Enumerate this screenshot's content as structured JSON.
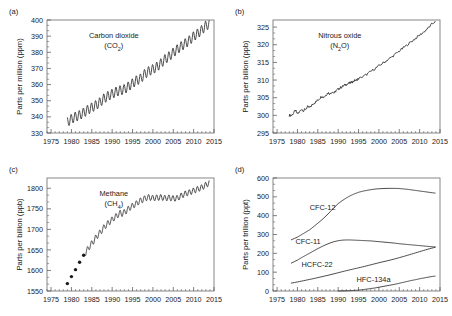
{
  "figure": {
    "title": "",
    "background_color": "#ffffff",
    "line_color": "#2b2b2b",
    "frame_color": "#7a7a7a"
  },
  "chart_data": [
    {
      "id": "panel-a",
      "type": "line",
      "panel_letter": "(a)",
      "title": "",
      "annotation": "Carbon dioxide",
      "annotation_sub": "(CO2)",
      "annotation_formula": "CO",
      "annotation_subscript": "2",
      "xlabel": "",
      "ylabel": "Parts per million (ppm)",
      "xlim": [
        1974,
        2015
      ],
      "ylim": [
        330,
        400
      ],
      "xticks": [
        1975,
        1980,
        1985,
        1990,
        1995,
        2000,
        2005,
        2010,
        2015
      ],
      "yticks": [
        330,
        340,
        350,
        360,
        370,
        380,
        390,
        400
      ],
      "minor_x_interval": 1,
      "minor_y_count": 2,
      "grid": false,
      "legend": "none",
      "seasonal_amplitude": 3.0,
      "seasonal_period": 1,
      "x": [
        1979.0,
        1980.0,
        1981.0,
        1982.0,
        1983.0,
        1984.0,
        1985.0,
        1986.0,
        1987.0,
        1988.0,
        1989.0,
        1990.0,
        1991.0,
        1992.0,
        1993.0,
        1994.0,
        1995.0,
        1996.0,
        1997.0,
        1998.0,
        1999.0,
        2000.0,
        2001.0,
        2002.0,
        2003.0,
        2004.0,
        2005.0,
        2006.0,
        2007.0,
        2008.0,
        2009.0,
        2010.0,
        2011.0,
        2012.0,
        2013.0,
        2013.8
      ],
      "values": [
        336.8,
        338.7,
        340.1,
        341.0,
        342.6,
        344.3,
        345.8,
        347.2,
        349.0,
        351.4,
        352.9,
        354.2,
        355.6,
        356.4,
        357.1,
        358.8,
        360.8,
        362.6,
        363.7,
        366.6,
        368.3,
        369.5,
        371.0,
        373.2,
        375.8,
        377.5,
        379.8,
        381.9,
        383.8,
        385.6,
        387.4,
        389.9,
        391.6,
        393.8,
        396.5,
        397.4
      ]
    },
    {
      "id": "panel-b",
      "type": "line",
      "panel_letter": "(b)",
      "title": "",
      "annotation": "Nitrous oxide",
      "annotation_sub": "(N2O)",
      "annotation_formula_pre": "(N",
      "annotation_subscript": "2",
      "annotation_formula_post": "O)",
      "xlabel": "",
      "ylabel": "Parts per billion (ppb)",
      "xlim": [
        1974,
        2015
      ],
      "ylim": [
        295,
        327
      ],
      "xticks": [
        1975,
        1980,
        1985,
        1990,
        1995,
        2000,
        2005,
        2010,
        2015
      ],
      "yticks": [
        295,
        300,
        305,
        310,
        315,
        320,
        325
      ],
      "minor_x_interval": 1,
      "minor_y_count": 2,
      "grid": false,
      "legend": "none",
      "noise_amplitude": 0.35,
      "x": [
        1978.0,
        1978.5,
        1979.0,
        1979.5,
        1980.0,
        1980.5,
        1981.0,
        1981.5,
        1982.0,
        1982.5,
        1983.0,
        1983.5,
        1984.0,
        1984.5,
        1985.0,
        1985.5,
        1986.0,
        1986.5,
        1987.0,
        1987.5,
        1988.0,
        1988.5,
        1989.0,
        1989.5,
        1990.0,
        1990.5,
        1991.0,
        1991.5,
        1992.0,
        1992.5,
        1993.0,
        1993.5,
        1994.0,
        1994.5,
        1995.0,
        1996.0,
        1997.0,
        1998.0,
        1999.0,
        2000.0,
        2001.0,
        2002.0,
        2003.0,
        2004.0,
        2005.0,
        2006.0,
        2007.0,
        2008.0,
        2009.0,
        2010.0,
        2011.0,
        2012.0,
        2013.0,
        2013.8
      ],
      "values": [
        300.1,
        299.9,
        300.6,
        301.4,
        300.4,
        300.9,
        301.8,
        301.3,
        301.8,
        302.4,
        302.2,
        302.8,
        303.4,
        303.8,
        304.3,
        304.9,
        305.4,
        305.1,
        305.8,
        306.4,
        306.1,
        306.7,
        306.3,
        307.0,
        307.4,
        307.8,
        308.1,
        308.5,
        308.8,
        309.0,
        309.2,
        309.5,
        309.8,
        310.0,
        310.4,
        310.9,
        311.6,
        312.4,
        313.2,
        314.0,
        314.8,
        315.6,
        316.4,
        317.3,
        318.2,
        319.1,
        320.0,
        320.9,
        321.8,
        322.7,
        323.6,
        324.6,
        325.8,
        326.6
      ]
    },
    {
      "id": "panel-c",
      "type": "line",
      "panel_letter": "(c)",
      "title": "",
      "annotation": "Methane",
      "annotation_sub": "(CH4)",
      "annotation_formula_pre": "(CH",
      "annotation_subscript": "4",
      "annotation_formula_post": ")",
      "xlabel": "",
      "ylabel": "Parts per billion (ppb)",
      "xlim": [
        1974,
        2015
      ],
      "ylim": [
        1550,
        1825
      ],
      "xticks": [
        1975,
        1980,
        1985,
        1990,
        1995,
        2000,
        2005,
        2010,
        2015
      ],
      "yticks": [
        1550,
        1600,
        1650,
        1700,
        1750,
        1800
      ],
      "minor_x_interval": 1,
      "minor_y_count": 2,
      "grid": false,
      "legend": "none",
      "seasonal_amplitude": 7.0,
      "marker_points_x": [
        1979.0,
        1980.0,
        1981.0,
        1982.0,
        1983.0
      ],
      "marker_points_y": [
        1568,
        1585,
        1602,
        1620,
        1637
      ],
      "x": [
        1983.5,
        1984.0,
        1984.5,
        1985.0,
        1985.5,
        1986.0,
        1986.5,
        1987.0,
        1987.5,
        1988.0,
        1988.5,
        1989.0,
        1989.5,
        1990.0,
        1990.5,
        1991.0,
        1991.5,
        1992.0,
        1992.5,
        1993.0,
        1993.5,
        1994.0,
        1994.5,
        1995.0,
        1995.5,
        1996.0,
        1996.5,
        1997.0,
        1997.5,
        1998.0,
        1998.5,
        1999.0,
        2000.0,
        2001.0,
        2002.0,
        2003.0,
        2004.0,
        2005.0,
        2006.0,
        2007.0,
        2008.0,
        2009.0,
        2010.0,
        2011.0,
        2012.0,
        2013.0,
        2013.8
      ],
      "values": [
        1643,
        1652,
        1659,
        1666,
        1672,
        1680,
        1686,
        1692,
        1698,
        1705,
        1710,
        1715,
        1719,
        1724,
        1728,
        1732,
        1736,
        1740,
        1738,
        1742,
        1745,
        1750,
        1754,
        1757,
        1760,
        1763,
        1767,
        1770,
        1772,
        1775,
        1777,
        1778,
        1776,
        1777,
        1778,
        1776,
        1777,
        1775,
        1776,
        1782,
        1787,
        1790,
        1794,
        1798,
        1802,
        1808,
        1813
      ]
    },
    {
      "id": "panel-d",
      "type": "line",
      "panel_letter": "(d)",
      "title": "",
      "annotation": "",
      "xlabel": "",
      "ylabel": "Parts per trillion (ppt)",
      "xlim": [
        1974,
        2015
      ],
      "ylim": [
        0,
        600
      ],
      "xticks": [
        1975,
        1980,
        1985,
        1990,
        1995,
        2000,
        2005,
        2010,
        2015
      ],
      "yticks": [
        0,
        100,
        200,
        300,
        400,
        500,
        600
      ],
      "minor_x_interval": 1,
      "minor_y_count": 2,
      "grid": false,
      "legend": "inline-labels",
      "series": [
        {
          "name": "CFC-12",
          "label_x": 1983.0,
          "label_y": 432,
          "x": [
            1978.5,
            1980.0,
            1981.0,
            1982.0,
            1983.0,
            1984.0,
            1985.0,
            1986.0,
            1987.0,
            1988.0,
            1989.0,
            1990.0,
            1991.0,
            1992.0,
            1993.0,
            1994.0,
            1995.0,
            1996.0,
            1997.0,
            1998.0,
            1999.0,
            2000.0,
            2001.0,
            2002.0,
            2003.0,
            2004.0,
            2005.0,
            2006.0,
            2007.0,
            2008.0,
            2009.0,
            2010.0,
            2011.0,
            2012.0,
            2013.0,
            2013.8
          ],
          "values": [
            272,
            286,
            299,
            312,
            325,
            342,
            360,
            378,
            398,
            420,
            443,
            464,
            480,
            494,
            506,
            516,
            524,
            530,
            534,
            538,
            541,
            543,
            544,
            545,
            545,
            545,
            544,
            542,
            540,
            537,
            534,
            531,
            528,
            525,
            522,
            520
          ]
        },
        {
          "name": "CFC-11",
          "label_x": 1979.5,
          "label_y": 248,
          "x": [
            1978.5,
            1980.0,
            1981.0,
            1982.0,
            1983.0,
            1984.0,
            1985.0,
            1986.0,
            1987.0,
            1988.0,
            1989.0,
            1990.0,
            1991.0,
            1992.0,
            1993.0,
            1994.0,
            1995.0,
            1996.0,
            1997.0,
            1998.0,
            1999.0,
            2000.0,
            2001.0,
            2002.0,
            2003.0,
            2004.0,
            2005.0,
            2006.0,
            2007.0,
            2008.0,
            2009.0,
            2010.0,
            2011.0,
            2012.0,
            2013.0,
            2013.8
          ],
          "values": [
            148,
            164,
            177,
            189,
            201,
            213,
            225,
            236,
            246,
            255,
            262,
            267,
            270,
            271,
            271,
            270,
            269,
            268,
            267,
            266,
            264,
            262,
            260,
            258,
            256,
            254,
            251,
            249,
            247,
            245,
            243,
            241,
            239,
            237,
            235,
            234
          ]
        },
        {
          "name": "HCFC-22",
          "label_x": 1981.0,
          "label_y": 128,
          "x": [
            1978.5,
            1980.0,
            1982.0,
            1984.0,
            1986.0,
            1988.0,
            1990.0,
            1992.0,
            1994.0,
            1996.0,
            1998.0,
            2000.0,
            2002.0,
            2004.0,
            2006.0,
            2008.0,
            2010.0,
            2012.0,
            2013.8
          ],
          "values": [
            42,
            48,
            57,
            66,
            76,
            86,
            97,
            108,
            118,
            128,
            139,
            150,
            160,
            171,
            183,
            196,
            209,
            222,
            232
          ]
        },
        {
          "name": "HFC-134a",
          "label_x": 1994.5,
          "label_y": 47,
          "x": [
            1990.0,
            1992.0,
            1993.0,
            1994.0,
            1995.0,
            1996.0,
            1997.0,
            1998.0,
            1999.0,
            2000.0,
            2001.0,
            2002.0,
            2003.0,
            2004.0,
            2005.0,
            2006.0,
            2007.0,
            2008.0,
            2009.0,
            2010.0,
            2011.0,
            2012.0,
            2013.0,
            2013.8
          ],
          "values": [
            0,
            1,
            2,
            3,
            5,
            7,
            10,
            13,
            16,
            20,
            24,
            28,
            32,
            36,
            41,
            46,
            51,
            56,
            60,
            65,
            69,
            73,
            77,
            79
          ]
        }
      ]
    }
  ]
}
